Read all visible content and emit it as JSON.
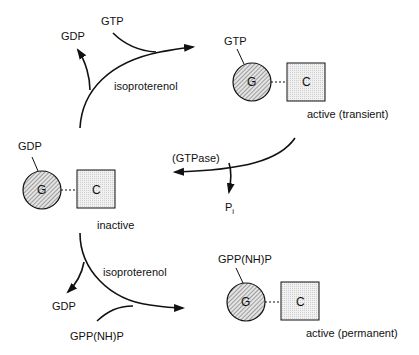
{
  "diagram": {
    "type": "reaction-cycle",
    "colors": {
      "line": "#111111",
      "g_fill": "#cfcfcf",
      "c_fill": "#ececec"
    },
    "top_reaction": {
      "input": "GTP",
      "output": "GDP",
      "catalyst": "isoproterenol"
    },
    "active_transient": {
      "nucleotide": "GTP",
      "g_label": "G",
      "c_label": "C",
      "state": "active (transient)"
    },
    "hydrolysis": {
      "enzyme": "(GTPase)",
      "product": "P",
      "product_sub": "i"
    },
    "inactive": {
      "nucleotide": "GDP",
      "g_label": "G",
      "c_label": "C",
      "state": "inactive"
    },
    "bottom_reaction": {
      "input": "GPP(NH)P",
      "output": "GDP",
      "catalyst": "isoproterenol"
    },
    "active_permanent": {
      "nucleotide": "GPP(NH)P",
      "g_label": "G",
      "c_label": "C",
      "state": "active (permanent)"
    }
  }
}
